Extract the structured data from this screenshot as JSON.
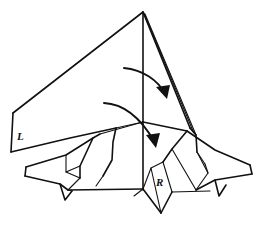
{
  "figure": {
    "background_color": "#ffffff",
    "ink_color": "#111111",
    "canvas": {
      "width": 265,
      "height": 227
    }
  },
  "labels": [
    {
      "id": "left-point-label",
      "text": "L",
      "x": 17,
      "y": 140,
      "name": "label-L"
    },
    {
      "id": "right-point-label",
      "text": "R",
      "x": 156,
      "y": 186,
      "name": "label-R"
    }
  ],
  "arrows": [
    {
      "id": "upper-fold-arrow",
      "name": "fold-arrow-upper",
      "description": "curved arrow sweeping right and down from near the center of the large upper triangle",
      "path": "M 124 68 C 143 70, 158 80, 166 95",
      "head_points": "166,98 157,88 170,86",
      "head_rotation_deg": 58
    },
    {
      "id": "lower-fold-arrow",
      "name": "fold-arrow-lower",
      "description": "curved arrow sweeping right and down across the body toward the lower right",
      "path": "M 104 103 C 124 105, 140 118, 155 143",
      "head_points": "156,147 147,136 160,134",
      "head_rotation_deg": 62
    }
  ],
  "shape_groups": [
    {
      "name": "upper-large-triangle",
      "description": "Large kite-like triangle from the apex down to the left point and down to the center base"
    },
    {
      "name": "center-spine",
      "description": "Vertical center fold line running from the apex down to the base"
    },
    {
      "name": "right-narrow-flap",
      "description": "Narrow sliver of nearly parallel lines running from the apex to the lower right"
    },
    {
      "name": "left-leg-and-foot",
      "description": "Left leg quadrilateral and pointed foot with a notch at the bottom"
    },
    {
      "name": "right-leg-and-foot",
      "description": "Right leg and pointed foot extending to the right edge with a notch"
    },
    {
      "name": "bottom-center-point",
      "description": "Downward point below the R label at the bottom center"
    }
  ]
}
